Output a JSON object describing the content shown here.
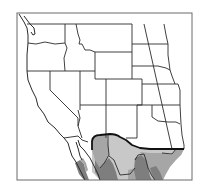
{
  "map": {
    "type": "range-map",
    "region": "Western United States and northern Mexico",
    "colors": {
      "background": "#ffffff",
      "border": "#2a2a2a",
      "frame": "#6a6a6a",
      "range_light": "#c8c8c8",
      "range_medium": "#a6a6a6",
      "range_dark": "#7e7e7e",
      "range_outline": "#111111"
    },
    "shaded_zones": [
      {
        "name": "light-zone",
        "shade": "light"
      },
      {
        "name": "medium-zone",
        "shade": "medium"
      },
      {
        "name": "dark-zone",
        "shade": "dark"
      }
    ]
  }
}
